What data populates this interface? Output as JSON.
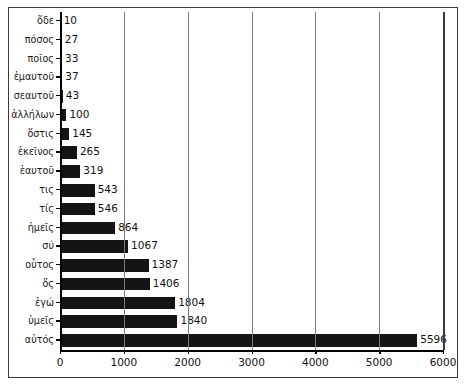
{
  "chart_data": {
    "type": "bar",
    "orientation": "horizontal",
    "title": "",
    "subtitle": "",
    "xlabel": "",
    "ylabel": "",
    "xlim": [
      0,
      6000
    ],
    "ylim": null,
    "grid": true,
    "legend": null,
    "xticks": [
      "0",
      "1000",
      "2000",
      "3000",
      "4000",
      "5000",
      "6000"
    ],
    "xtick_values": [
      0,
      1000,
      2000,
      3000,
      4000,
      5000,
      6000
    ],
    "categories": [
      "ὅδε",
      "πόσος",
      "ποῖος",
      "ἐμαυτοῦ",
      "σεαυτοῦ",
      "ἀλλήλων",
      "ὅστις",
      "ἐκεῖνος",
      "ἑαυτοῦ",
      "τις",
      "τίς",
      "ἡμεῖς",
      "σύ",
      "οὗτος",
      "ὅς",
      "ἐγώ",
      "ὑμεῖς",
      "αὐτός"
    ],
    "values": [
      10,
      27,
      33,
      37,
      43,
      100,
      145,
      265,
      319,
      543,
      546,
      864,
      1067,
      1387,
      1406,
      1804,
      1840,
      5596
    ],
    "data_labels": [
      "10",
      "27",
      "33",
      "37",
      "43",
      "100",
      "145",
      "265",
      "319",
      "543",
      "546",
      "864",
      "1067",
      "1387",
      "1406",
      "1804",
      "1840",
      "5596"
    ],
    "bar_color": "#141414",
    "grid_color": "#7d7d7d",
    "axis_color": "#000000",
    "background": "#ffffff"
  }
}
